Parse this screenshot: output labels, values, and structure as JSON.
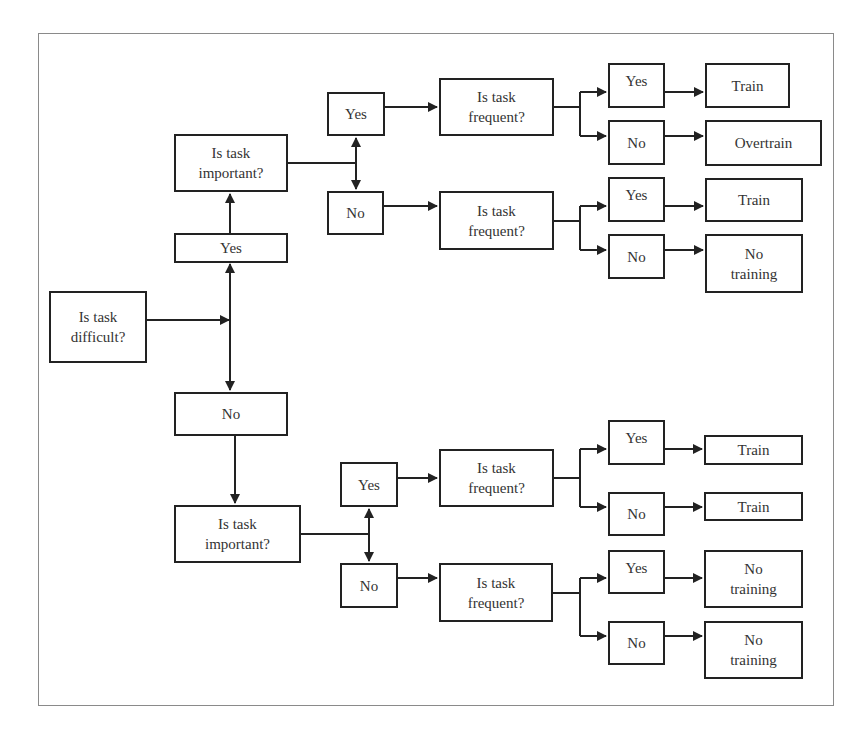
{
  "diagram": {
    "type": "decision-flowchart",
    "root": {
      "label": "Is task\ndifficult?"
    },
    "difficult_yes": {
      "label": "Yes"
    },
    "difficult_no": {
      "label": "No"
    },
    "top": {
      "important": {
        "label": "Is task\nimportant?"
      },
      "imp_yes": {
        "label": "Yes"
      },
      "imp_no": {
        "label": "No"
      },
      "freq_a": {
        "label": "Is task\nfrequent?",
        "yes": "Yes",
        "no": "No",
        "yes_result": "Train",
        "no_result": "Overtrain"
      },
      "freq_b": {
        "label": "Is task\nfrequent?",
        "yes": "Yes",
        "no": "No",
        "yes_result": "Train",
        "no_result": "No\ntraining"
      }
    },
    "bottom": {
      "important": {
        "label": "Is task\nimportant?"
      },
      "imp_yes": {
        "label": "Yes"
      },
      "imp_no": {
        "label": "No"
      },
      "freq_c": {
        "label": "Is task\nfrequent?",
        "yes": "Yes",
        "no": "No",
        "yes_result": "Train",
        "no_result": "Train"
      },
      "freq_d": {
        "label": "Is task\nfrequent?",
        "yes": "Yes",
        "no": "No",
        "yes_result": "No\ntraining",
        "no_result": "No\ntraining"
      }
    }
  },
  "colors": {
    "line": "#222222",
    "frame": "#8a8a8a",
    "text": "#333333"
  }
}
